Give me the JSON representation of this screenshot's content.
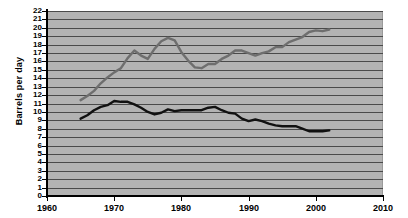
{
  "chart_data": {
    "type": "line",
    "title": "",
    "xlabel": "",
    "ylabel": "Barrels per day",
    "xlim": [
      1960,
      2010
    ],
    "ylim": [
      0,
      22
    ],
    "xticks": [
      1960,
      1970,
      1980,
      1990,
      2000,
      2010
    ],
    "yticks": [
      0,
      1,
      2,
      3,
      4,
      5,
      6,
      7,
      8,
      9,
      10,
      11,
      12,
      13,
      14,
      15,
      16,
      17,
      18,
      19,
      20,
      21,
      22
    ],
    "grid": "horizontal",
    "legend": "none",
    "x": [
      1965,
      1966,
      1967,
      1968,
      1969,
      1970,
      1971,
      1972,
      1973,
      1974,
      1975,
      1976,
      1977,
      1978,
      1979,
      1980,
      1981,
      1982,
      1983,
      1984,
      1985,
      1986,
      1987,
      1988,
      1989,
      1990,
      1991,
      1992,
      1993,
      1994,
      1995,
      1996,
      1997,
      1998,
      1999,
      2000,
      2001,
      2002
    ],
    "series": [
      {
        "name": "consumption",
        "color": "#6e6e6e",
        "values": [
          11.4,
          11.9,
          12.5,
          13.4,
          14.1,
          14.7,
          15.2,
          16.4,
          17.3,
          16.7,
          16.3,
          17.5,
          18.4,
          18.8,
          18.5,
          17.1,
          16.1,
          15.3,
          15.2,
          15.7,
          15.7,
          16.3,
          16.7,
          17.3,
          17.3,
          17.0,
          16.7,
          17.0,
          17.2,
          17.7,
          17.7,
          18.3,
          18.6,
          18.9,
          19.5,
          19.7,
          19.6,
          19.8
        ]
      },
      {
        "name": "production",
        "color": "#111111",
        "values": [
          9.2,
          9.6,
          10.2,
          10.6,
          10.8,
          11.3,
          11.2,
          11.2,
          10.9,
          10.5,
          10.0,
          9.7,
          9.9,
          10.3,
          10.1,
          10.2,
          10.2,
          10.2,
          10.2,
          10.5,
          10.6,
          10.2,
          9.9,
          9.8,
          9.2,
          8.9,
          9.1,
          8.9,
          8.6,
          8.4,
          8.3,
          8.3,
          8.3,
          8.0,
          7.7,
          7.7,
          7.7,
          7.8
        ]
      }
    ]
  }
}
